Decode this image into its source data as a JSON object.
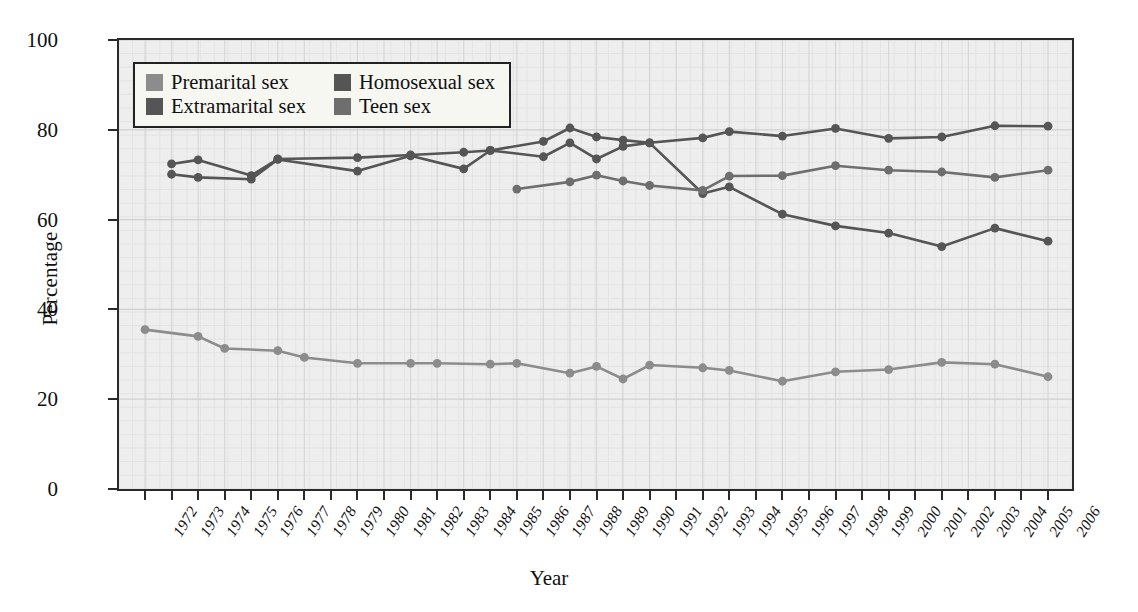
{
  "chart_data": {
    "type": "line",
    "title": "",
    "xlabel": "Year",
    "ylabel": "Percentage",
    "ylim": [
      0,
      100
    ],
    "yticks": [
      0,
      20,
      40,
      60,
      80,
      100
    ],
    "xlim": [
      1972,
      2006
    ],
    "grid": true,
    "legend_position": "top-left",
    "categories": [
      1972,
      1973,
      1974,
      1975,
      1976,
      1977,
      1978,
      1979,
      1980,
      1981,
      1982,
      1983,
      1984,
      1985,
      1986,
      1987,
      1988,
      1989,
      1990,
      1991,
      1992,
      1993,
      1994,
      1995,
      1996,
      1997,
      1998,
      1999,
      2000,
      2001,
      2002,
      2003,
      2004,
      2005,
      2006
    ],
    "series": [
      {
        "name": "Premarital sex",
        "color": "#8c8c8c",
        "points": [
          {
            "x": 1972,
            "y": 35.5
          },
          {
            "x": 1974,
            "y": 34.0
          },
          {
            "x": 1975,
            "y": 31.3
          },
          {
            "x": 1977,
            "y": 30.8
          },
          {
            "x": 1978,
            "y": 29.3
          },
          {
            "x": 1980,
            "y": 28.0
          },
          {
            "x": 1982,
            "y": 28.0
          },
          {
            "x": 1983,
            "y": 28.0
          },
          {
            "x": 1985,
            "y": 27.8
          },
          {
            "x": 1986,
            "y": 28.0
          },
          {
            "x": 1988,
            "y": 25.8
          },
          {
            "x": 1989,
            "y": 27.3
          },
          {
            "x": 1990,
            "y": 24.5
          },
          {
            "x": 1991,
            "y": 27.6
          },
          {
            "x": 1993,
            "y": 27.0
          },
          {
            "x": 1994,
            "y": 26.4
          },
          {
            "x": 1996,
            "y": 24.0
          },
          {
            "x": 1998,
            "y": 26.1
          },
          {
            "x": 2000,
            "y": 26.6
          },
          {
            "x": 2002,
            "y": 28.2
          },
          {
            "x": 2004,
            "y": 27.8
          },
          {
            "x": 2006,
            "y": 25.0
          }
        ]
      },
      {
        "name": "Extramarital sex",
        "color": "#555555",
        "points": [
          {
            "x": 1973,
            "y": 70.1
          },
          {
            "x": 1974,
            "y": 69.4
          },
          {
            "x": 1976,
            "y": 69.0
          },
          {
            "x": 1977,
            "y": 73.4
          },
          {
            "x": 1980,
            "y": 70.8
          },
          {
            "x": 1982,
            "y": 74.2
          },
          {
            "x": 1984,
            "y": 71.3
          },
          {
            "x": 1985,
            "y": 75.4
          },
          {
            "x": 1987,
            "y": 74.0
          },
          {
            "x": 1988,
            "y": 77.1
          },
          {
            "x": 1989,
            "y": 73.5
          },
          {
            "x": 1990,
            "y": 76.3
          },
          {
            "x": 1991,
            "y": 77.1
          },
          {
            "x": 1993,
            "y": 78.2
          },
          {
            "x": 1994,
            "y": 79.6
          },
          {
            "x": 1996,
            "y": 78.6
          },
          {
            "x": 1998,
            "y": 80.3
          },
          {
            "x": 2000,
            "y": 78.1
          },
          {
            "x": 2002,
            "y": 78.4
          },
          {
            "x": 2004,
            "y": 80.9
          },
          {
            "x": 2006,
            "y": 80.8
          }
        ]
      },
      {
        "name": "Homosexual sex",
        "color": "#555555",
        "points": [
          {
            "x": 1973,
            "y": 72.4
          },
          {
            "x": 1974,
            "y": 73.3
          },
          {
            "x": 1976,
            "y": 69.8
          },
          {
            "x": 1977,
            "y": 73.5
          },
          {
            "x": 1980,
            "y": 73.8
          },
          {
            "x": 1982,
            "y": 74.4
          },
          {
            "x": 1984,
            "y": 75.0
          },
          {
            "x": 1985,
            "y": 75.4
          },
          {
            "x": 1987,
            "y": 77.4
          },
          {
            "x": 1988,
            "y": 80.4
          },
          {
            "x": 1989,
            "y": 78.4
          },
          {
            "x": 1990,
            "y": 77.7
          },
          {
            "x": 1991,
            "y": 77.1
          },
          {
            "x": 1993,
            "y": 65.8
          },
          {
            "x": 1994,
            "y": 67.3
          },
          {
            "x": 1996,
            "y": 61.2
          },
          {
            "x": 1998,
            "y": 58.6
          },
          {
            "x": 2000,
            "y": 57.0
          },
          {
            "x": 2002,
            "y": 54.0
          },
          {
            "x": 2004,
            "y": 58.1
          },
          {
            "x": 2006,
            "y": 55.2
          }
        ]
      },
      {
        "name": "Teen sex",
        "color": "#6e6e6e",
        "points": [
          {
            "x": 1986,
            "y": 66.8
          },
          {
            "x": 1988,
            "y": 68.4
          },
          {
            "x": 1989,
            "y": 69.9
          },
          {
            "x": 1990,
            "y": 68.6
          },
          {
            "x": 1991,
            "y": 67.6
          },
          {
            "x": 1993,
            "y": 66.5
          },
          {
            "x": 1994,
            "y": 69.7
          },
          {
            "x": 1996,
            "y": 69.8
          },
          {
            "x": 1998,
            "y": 72.0
          },
          {
            "x": 2000,
            "y": 71.0
          },
          {
            "x": 2002,
            "y": 70.6
          },
          {
            "x": 2004,
            "y": 69.4
          },
          {
            "x": 2006,
            "y": 71.0
          }
        ]
      }
    ]
  },
  "legend": {
    "entries": [
      {
        "label": "Premarital sex",
        "color": "#8c8c8c"
      },
      {
        "label": "Homosexual sex",
        "color": "#555555"
      },
      {
        "label": "Extramarital sex",
        "color": "#555555"
      },
      {
        "label": "Teen sex",
        "color": "#6e6e6e"
      }
    ]
  },
  "axes": {
    "y_title": "Percentage",
    "x_title": "Year"
  }
}
